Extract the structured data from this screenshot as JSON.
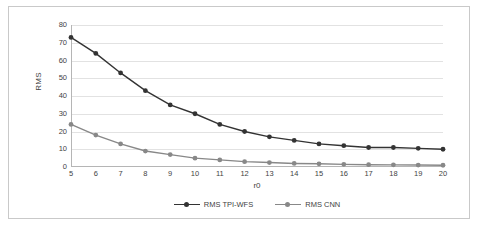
{
  "chart": {
    "axis": {
      "xlabel": "r0",
      "ylabel": "RMS",
      "yticks": [
        "0",
        "10",
        "20",
        "30",
        "40",
        "50",
        "60",
        "70",
        "80"
      ],
      "xticks": [
        "5",
        "6",
        "7",
        "8",
        "9",
        "10",
        "11",
        "12",
        "13",
        "14",
        "15",
        "16",
        "17",
        "18",
        "19",
        "20"
      ]
    },
    "legend": {
      "items": [
        {
          "label": "RMS TPI-WFS",
          "color": "#333333"
        },
        {
          "label": "RMS CNN",
          "color": "#888888"
        }
      ]
    }
  },
  "chart_data": {
    "type": "line",
    "title": "",
    "xlabel": "r0",
    "ylabel": "RMS",
    "x": [
      5,
      6,
      7,
      8,
      9,
      10,
      11,
      12,
      13,
      14,
      15,
      16,
      17,
      18,
      19,
      20
    ],
    "xlim": [
      5,
      20
    ],
    "ylim": [
      0,
      80
    ],
    "grid": true,
    "legend_position": "bottom",
    "series": [
      {
        "name": "RMS TPI-WFS",
        "color": "#333333",
        "values": [
          73,
          64,
          53,
          43,
          35,
          30,
          24,
          20,
          17,
          15,
          13,
          12,
          11,
          11,
          10.5,
          10
        ]
      },
      {
        "name": "RMS CNN",
        "color": "#888888",
        "values": [
          24,
          18,
          13,
          9,
          7,
          5,
          4,
          3,
          2.5,
          2,
          1.8,
          1.5,
          1.3,
          1.2,
          1.1,
          1
        ]
      }
    ]
  }
}
